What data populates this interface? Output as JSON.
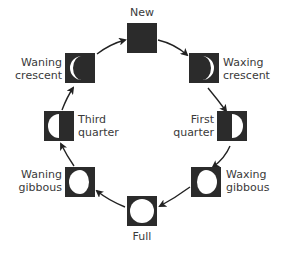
{
  "phases": [
    {
      "id": "new",
      "label": "New",
      "lines": [
        "New"
      ]
    },
    {
      "id": "waxing-crescent",
      "label": "Waxing crescent",
      "lines": [
        "Waxing",
        "crescent"
      ]
    },
    {
      "id": "first-quarter",
      "label": "First quarter",
      "lines": [
        "First",
        "quarter"
      ]
    },
    {
      "id": "waxing-gibbous",
      "label": "Waxing gibbous",
      "lines": [
        "Waxing",
        "gibbous"
      ]
    },
    {
      "id": "full",
      "label": "Full",
      "lines": [
        "Full"
      ]
    },
    {
      "id": "waning-gibbous",
      "label": "Waning gibbous",
      "lines": [
        "Waning",
        "gibbous"
      ]
    },
    {
      "id": "third-quarter",
      "label": "Third quarter",
      "lines": [
        "Third",
        "quarter"
      ]
    },
    {
      "id": "waning-crescent",
      "label": "Waning crescent",
      "lines": [
        "Waning",
        "crescent"
      ]
    }
  ],
  "colors": {
    "box": "#2b2b2b",
    "moon": "#ffffff",
    "arrow": "#222222"
  }
}
